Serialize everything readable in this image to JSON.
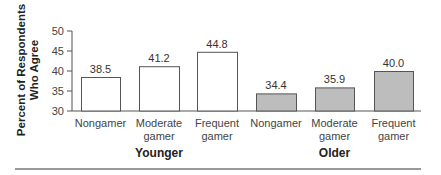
{
  "chart_data": {
    "type": "bar",
    "title": "",
    "ylabel": "Percent of Respondents Who Agree",
    "ylabel_lines": [
      "Percent of Respondents",
      "Who Agree"
    ],
    "xlabel": "",
    "ylim": [
      30,
      50
    ],
    "yticks": [
      30,
      35,
      40,
      45,
      50
    ],
    "grid": false,
    "legend": null,
    "groups": [
      {
        "name": "Younger",
        "color": "#ffffff",
        "categories": [
          [
            "Nongamer"
          ],
          [
            "Moderate",
            "gamer"
          ],
          [
            "Frequent",
            "gamer"
          ]
        ],
        "values": [
          38.5,
          41.2,
          44.8
        ],
        "value_labels": [
          "38.5",
          "41.2",
          "44.8"
        ]
      },
      {
        "name": "Older",
        "color": "#bdbdbd",
        "categories": [
          [
            "Nongamer"
          ],
          [
            "Moderate",
            "gamer"
          ],
          [
            "Frequent",
            "gamer"
          ]
        ],
        "values": [
          34.4,
          35.9,
          40.0
        ],
        "value_labels": [
          "34.4",
          "35.9",
          "40.0"
        ]
      }
    ],
    "colors": {
      "axis": "#555555",
      "bar_outline": "#555555",
      "younger_fill": "#ffffff",
      "older_fill": "#bdbdbd",
      "text": "#333333",
      "rule": "#777777"
    }
  }
}
